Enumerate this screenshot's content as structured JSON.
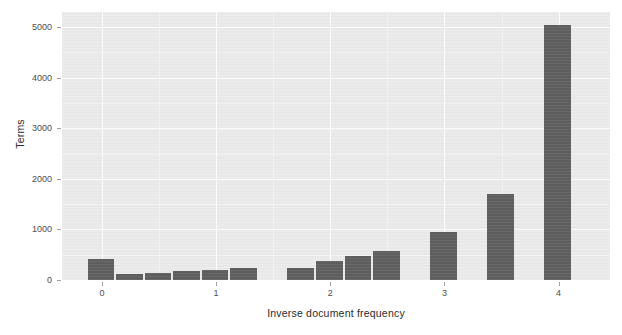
{
  "chart_data": {
    "type": "bar",
    "title": "",
    "subtitle": "",
    "xlabel": "Inverse document frequency",
    "ylabel": "Terms",
    "xlim": [
      -0.35,
      4.45
    ],
    "ylim": [
      0,
      5300
    ],
    "grid": true,
    "legend": null,
    "bin_width": 0.25,
    "x_ticks": [
      "0",
      "1",
      "2",
      "3",
      "4"
    ],
    "x_tick_values": [
      0,
      1,
      2,
      3,
      4
    ],
    "y_ticks": [
      "0",
      "1000",
      "2000",
      "3000",
      "4000",
      "5000"
    ],
    "y_tick_values": [
      0,
      1000,
      2000,
      3000,
      4000,
      5000
    ],
    "bars": [
      {
        "x": 0.0,
        "value": 420
      },
      {
        "x": 0.25,
        "value": 120
      },
      {
        "x": 0.5,
        "value": 130
      },
      {
        "x": 0.75,
        "value": 170
      },
      {
        "x": 1.0,
        "value": 200
      },
      {
        "x": 1.25,
        "value": 230
      },
      {
        "x": 1.75,
        "value": 240
      },
      {
        "x": 2.0,
        "value": 370
      },
      {
        "x": 2.25,
        "value": 470
      },
      {
        "x": 2.5,
        "value": 570
      },
      {
        "x": 3.0,
        "value": 950
      },
      {
        "x": 3.5,
        "value": 1700
      },
      {
        "x": 4.0,
        "value": 5050
      }
    ],
    "colors": {
      "bar": "#5f5f5f",
      "panel_background": "#ebebeb",
      "grid_major": "#ffffff",
      "grid_minor": "#f5f5f5",
      "axis_text": "#4d4d4d",
      "axis_title": "#2b2b2b",
      "figure_background": "#ffffff"
    }
  }
}
